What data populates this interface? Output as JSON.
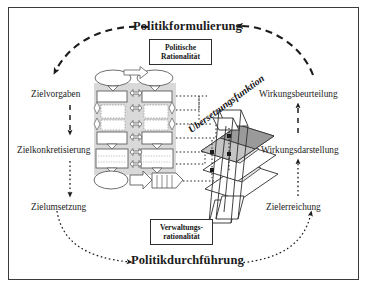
{
  "figure": {
    "title_top": "Politikformulierung",
    "title_bottom": "Politikdurchführung",
    "border_color": "#3b3b3b",
    "background": "#ffffff"
  },
  "rationality_boxes": {
    "top": {
      "line1": "Politische",
      "line2": "Rationalität"
    },
    "bottom": {
      "line1": "Verwaltungs-",
      "line2": "rationalität"
    }
  },
  "phases": {
    "left": [
      {
        "label": "Zielvorgaben"
      },
      {
        "label": "Zielkonkretisierung"
      },
      {
        "label": "Zielumsetzung"
      }
    ],
    "right": [
      {
        "label": "Wirkungsbeurteilung"
      },
      {
        "label": "Wirkungsdarstellung"
      },
      {
        "label": "Zielerreichung"
      }
    ]
  },
  "center": {
    "translation_label": "Übersetzungsfunktion"
  },
  "colors": {
    "ink": "#1c1c1c",
    "line": "#2e2e2e",
    "flow_panel_fill": "#d9d9d9",
    "shape_fill": "#ffffff",
    "prism_shade_dark": "#9a9a9a",
    "prism_shade_mid": "#c4c4c4",
    "prism_shade_light": "#e4e4e4"
  }
}
